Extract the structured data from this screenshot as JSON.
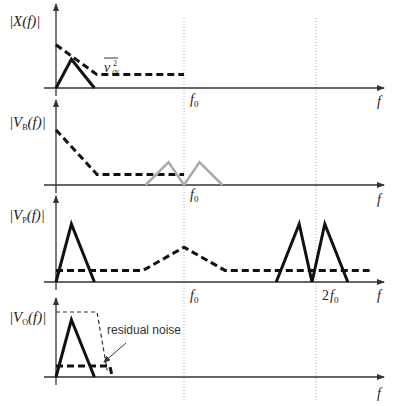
{
  "figure": {
    "frequency_axis_label": "f",
    "markers": {
      "f0": "f",
      "f0_sub": "0",
      "two_f0_prefix": "2",
      "two_f0": "f",
      "two_f0_sub": "0"
    },
    "colors": {
      "signal": "#111111",
      "noise": "#111111",
      "shifted_signal": "#aaaaaa",
      "gridline": "#999999"
    },
    "panels": [
      {
        "id": "input",
        "ylabel_prefix": "|",
        "ylabel_main": "X",
        "ylabel_sub": "",
        "ylabel_suffix": "(f)|",
        "annotation_main": "v",
        "annotation_sup": "2",
        "annotation_sub": "iN",
        "traces": [
          {
            "name": "signal",
            "style": "solid",
            "points_f_over_f0": [
              [
                0,
                0
              ],
              [
                0.12,
                0.6
              ],
              [
                0.3,
                0
              ]
            ]
          },
          {
            "name": "input-noise",
            "style": "dashed",
            "points_f_over_f0": [
              [
                0,
                0.9
              ],
              [
                0.32,
                0.28
              ],
              [
                1.0,
                0.28
              ]
            ]
          }
        ]
      },
      {
        "id": "modulated",
        "ylabel_prefix": "|",
        "ylabel_main": "V",
        "ylabel_sub": "B",
        "ylabel_suffix": "(f)|",
        "traces": [
          {
            "name": "input-noise",
            "style": "dashed",
            "points_f_over_f0": [
              [
                0,
                1.45
              ],
              [
                0.32,
                0.28
              ],
              [
                1.0,
                0.28
              ]
            ]
          },
          {
            "name": "modulated-signal",
            "style": "gray",
            "points_f_over_f0": [
              [
                0.7,
                0
              ],
              [
                0.88,
                0.6
              ],
              [
                1.0,
                0
              ],
              [
                1.12,
                0.6
              ],
              [
                1.3,
                0
              ]
            ]
          }
        ]
      },
      {
        "id": "demodulated",
        "ylabel_prefix": "|",
        "ylabel_main": "V",
        "ylabel_sub": "P",
        "ylabel_suffix": "(f)|",
        "traces": [
          {
            "name": "baseband-signal",
            "style": "solid",
            "points_f_over_f0": [
              [
                0,
                0
              ],
              [
                0.12,
                1.0
              ],
              [
                0.3,
                0
              ]
            ]
          },
          {
            "name": "signal-2f0-lower",
            "style": "solid",
            "points_f_over_f0": [
              [
                1.72,
                0
              ],
              [
                1.9,
                1.0
              ],
              [
                2.0,
                0
              ]
            ]
          },
          {
            "name": "signal-2f0-upper",
            "style": "solid",
            "points_f_over_f0": [
              [
                2.0,
                0
              ],
              [
                2.1,
                1.0
              ],
              [
                2.28,
                0
              ]
            ]
          },
          {
            "name": "shifted-noise",
            "style": "dashed",
            "points_f_over_f0": [
              [
                0,
                0.2
              ],
              [
                0.68,
                0.2
              ],
              [
                1.0,
                0.6
              ],
              [
                1.32,
                0.2
              ],
              [
                2.45,
                0.2
              ]
            ]
          }
        ]
      },
      {
        "id": "output",
        "ylabel_prefix": "|",
        "ylabel_main": "V",
        "ylabel_sub": "O",
        "ylabel_suffix": "(f)|",
        "annotation_text": "residual noise",
        "traces": [
          {
            "name": "lowpass-filter",
            "style": "thin-dashed",
            "points_f_over_f0": [
              [
                0,
                1.0
              ],
              [
                0.32,
                1.0
              ],
              [
                0.4,
                0.1
              ]
            ]
          },
          {
            "name": "baseband-signal",
            "style": "solid",
            "points_f_over_f0": [
              [
                0,
                0
              ],
              [
                0.12,
                0.88
              ],
              [
                0.3,
                0
              ]
            ]
          },
          {
            "name": "residual-noise",
            "style": "dashed",
            "points_f_over_f0": [
              [
                0,
                0.17
              ],
              [
                0.42,
                0.17
              ],
              [
                0.44,
                0
              ]
            ]
          }
        ]
      }
    ]
  }
}
